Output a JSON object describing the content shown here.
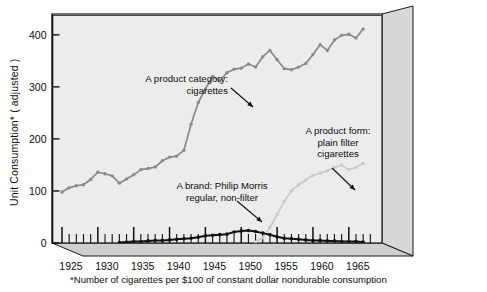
{
  "chart_data": {
    "type": "line",
    "title": "",
    "xlabel": "",
    "ylabel": "Unit Consumption*  ( adjusted )",
    "footnote": "*Number of cigarettes per $100 of constant dollar nondurable consumption",
    "xlim": [
      1925,
      1968
    ],
    "ylim": [
      0,
      440
    ],
    "yticks": [
      0,
      100,
      200,
      300,
      400
    ],
    "ytick_labels": [
      "0",
      "100",
      "200",
      "300",
      "400"
    ],
    "xticks": [
      1925,
      1930,
      1935,
      1940,
      1945,
      1950,
      1955,
      1960,
      1965
    ],
    "xtick_labels": [
      "1925",
      "1930",
      "1935",
      "1940",
      "1945",
      "1950",
      "1955",
      "1960",
      "1965"
    ],
    "xtick_minor_step": 1,
    "grid": false,
    "legend": "none",
    "series": [
      {
        "name": "A product category: cigarettes",
        "color": "#8a8a8a",
        "marker": "circle",
        "x": [
          1925,
          1926,
          1927,
          1928,
          1929,
          1930,
          1931,
          1932,
          1933,
          1934,
          1935,
          1936,
          1937,
          1938,
          1939,
          1940,
          1941,
          1942,
          1943,
          1944,
          1945,
          1946,
          1947,
          1948,
          1949,
          1950,
          1951,
          1952,
          1953,
          1954,
          1955,
          1956,
          1957,
          1958,
          1959,
          1960,
          1961,
          1962,
          1963,
          1964,
          1965,
          1966,
          1967
        ],
        "values": [
          98,
          106,
          110,
          112,
          122,
          136,
          133,
          129,
          115,
          123,
          131,
          141,
          143,
          146,
          158,
          165,
          167,
          178,
          228,
          270,
          296,
          320,
          311,
          327,
          334,
          336,
          344,
          338,
          358,
          370,
          352,
          335,
          333,
          338,
          345,
          362,
          381,
          370,
          390,
          399,
          401,
          394,
          411
        ]
      },
      {
        "name": "A product form: plain filter cigarettes",
        "color": "#c9c9c9",
        "marker": "circle",
        "x": [
          1952,
          1953,
          1954,
          1955,
          1956,
          1957,
          1958,
          1959,
          1960,
          1961,
          1962,
          1963,
          1964,
          1965,
          1966,
          1967
        ],
        "values": [
          2,
          10,
          30,
          55,
          80,
          100,
          112,
          121,
          130,
          134,
          139,
          145,
          150,
          141,
          145,
          153
        ]
      },
      {
        "name": "A brand: Philip Morris regular, non-filter",
        "color": "#111111",
        "marker": "circle",
        "x": [
          1933,
          1934,
          1935,
          1936,
          1937,
          1938,
          1939,
          1940,
          1941,
          1942,
          1943,
          1944,
          1945,
          1946,
          1947,
          1948,
          1949,
          1950,
          1951,
          1952,
          1953,
          1954,
          1955,
          1956,
          1957,
          1958,
          1959,
          1960,
          1961,
          1962,
          1963,
          1964,
          1965,
          1966,
          1967
        ],
        "values": [
          1,
          2,
          3,
          3,
          4,
          5,
          5,
          6,
          7,
          8,
          9,
          11,
          14,
          15,
          16,
          17,
          21,
          23,
          24,
          22,
          19,
          16,
          12,
          9,
          8,
          7,
          6,
          5,
          5,
          4,
          4,
          3,
          3,
          3,
          2
        ]
      }
    ],
    "annotations": [
      {
        "id": "category-annotation",
        "lines": [
          "A product category:",
          "cigarettes"
        ],
        "align": "right",
        "text_x": 228,
        "text_y": 82,
        "arrow": {
          "x1": 231,
          "y1": 88,
          "x2": 253,
          "y2": 107
        }
      },
      {
        "id": "form-annotation",
        "lines": [
          "A product form:",
          "plain filter",
          "cigarettes"
        ],
        "align": "center",
        "text_x": 338,
        "text_y": 134,
        "arrow": {
          "x1": 332,
          "y1": 168,
          "x2": 355,
          "y2": 190
        }
      },
      {
        "id": "brand-annotation",
        "lines": [
          "A brand: Philip Morris",
          "regular, non-filter"
        ],
        "align": "center",
        "text_x": 222,
        "text_y": 189,
        "arrow": {
          "x1": 237,
          "y1": 201,
          "x2": 262,
          "y2": 222
        }
      }
    ]
  },
  "style": {
    "plot_bg": "#ececec",
    "side_panel": "#d5d5d5",
    "floor_panel": "#cfcfcf",
    "axis_color": "#151515",
    "text_color": "#0d0d0d",
    "page_bg": "#ffffff"
  },
  "icons": {
    "arrow": "arrow-pointer-icon"
  }
}
